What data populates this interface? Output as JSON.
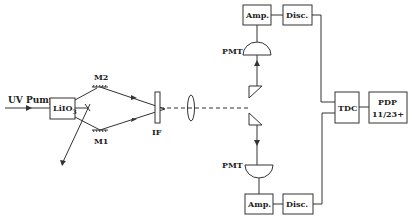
{
  "diagram": {
    "type": "optical-experiment-setup",
    "labels": {
      "uv_pump": "UV Pump",
      "crystal": "LiIO",
      "crystal_sub": "3",
      "mirror_top": "M2",
      "mirror_bottom": "M1",
      "filter": "IF",
      "pmt_top": "PMT",
      "pmt_bottom": "PMT",
      "amp_top": "Amp.",
      "amp_bottom": "Amp.",
      "disc_top": "Disc.",
      "disc_bottom": "Disc.",
      "tdc": "TDC",
      "pdp_line1": "PDP",
      "pdp_line2": "11/23+"
    },
    "colors": {
      "line": "#333333",
      "text": "#222222",
      "background": "#ffffff"
    }
  }
}
